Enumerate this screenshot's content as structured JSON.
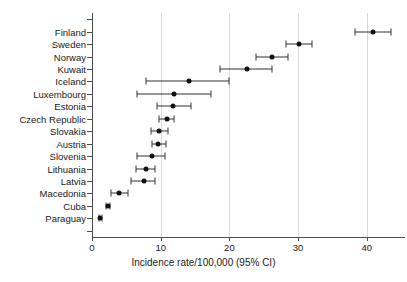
{
  "chart_data": {
    "type": "scatter",
    "title": "",
    "xlabel": "Incidence rate/100,000 (95% CI)",
    "ylabel": "",
    "xlim": [
      0,
      45.5
    ],
    "xticks": [
      0,
      10,
      20,
      30,
      40
    ],
    "xtick_labels": [
      "0",
      "10",
      "20",
      "30",
      "40"
    ],
    "grid": "vertical gridlines at 10, 20, 30, 40",
    "legend": "none",
    "orientation": "horizontal",
    "error_bars": "95% confidence intervals",
    "categories": [
      "Finland",
      "Sweden",
      "Norway",
      "Kuwait",
      "Iceland",
      "Luxembourg",
      "Estonia",
      "Czech Republic",
      "Slovakia",
      "Austria",
      "Slovenia",
      "Lithuania",
      "Latvia",
      "Macedonia",
      "Cuba",
      "Paraguay"
    ],
    "points": [
      {
        "label": "Finland",
        "value": 40.9,
        "ci_low": 38.3,
        "ci_high": 43.5
      },
      {
        "label": "Sweden",
        "value": 30.2,
        "ci_low": 28.3,
        "ci_high": 32.0
      },
      {
        "label": "Norway",
        "value": 26.2,
        "ci_low": 23.8,
        "ci_high": 28.6
      },
      {
        "label": "Kuwait",
        "value": 22.5,
        "ci_low": 18.6,
        "ci_high": 26.2
      },
      {
        "label": "Iceland",
        "value": 14.1,
        "ci_low": 7.9,
        "ci_high": 20.0
      },
      {
        "label": "Luxembourg",
        "value": 12.0,
        "ci_low": 6.5,
        "ci_high": 17.3
      },
      {
        "label": "Estonia",
        "value": 11.8,
        "ci_low": 9.4,
        "ci_high": 14.4
      },
      {
        "label": "Czech Republic",
        "value": 10.9,
        "ci_low": 9.8,
        "ci_high": 12.0
      },
      {
        "label": "Slovakia",
        "value": 9.8,
        "ci_low": 8.6,
        "ci_high": 11.1
      },
      {
        "label": "Austria",
        "value": 9.6,
        "ci_low": 8.7,
        "ci_high": 10.8
      },
      {
        "label": "Slovenia",
        "value": 8.7,
        "ci_low": 6.5,
        "ci_high": 10.6
      },
      {
        "label": "Lithuania",
        "value": 7.9,
        "ci_low": 6.4,
        "ci_high": 9.2
      },
      {
        "label": "Latvia",
        "value": 7.5,
        "ci_low": 5.7,
        "ci_high": 9.2
      },
      {
        "label": "Macedonia",
        "value": 3.9,
        "ci_low": 2.8,
        "ci_high": 5.2
      },
      {
        "label": "Cuba",
        "value": 2.3,
        "ci_low": 2.0,
        "ci_high": 2.6
      },
      {
        "label": "Paraguay",
        "value": 1.2,
        "ci_low": 1.0,
        "ci_high": 1.5
      }
    ]
  }
}
